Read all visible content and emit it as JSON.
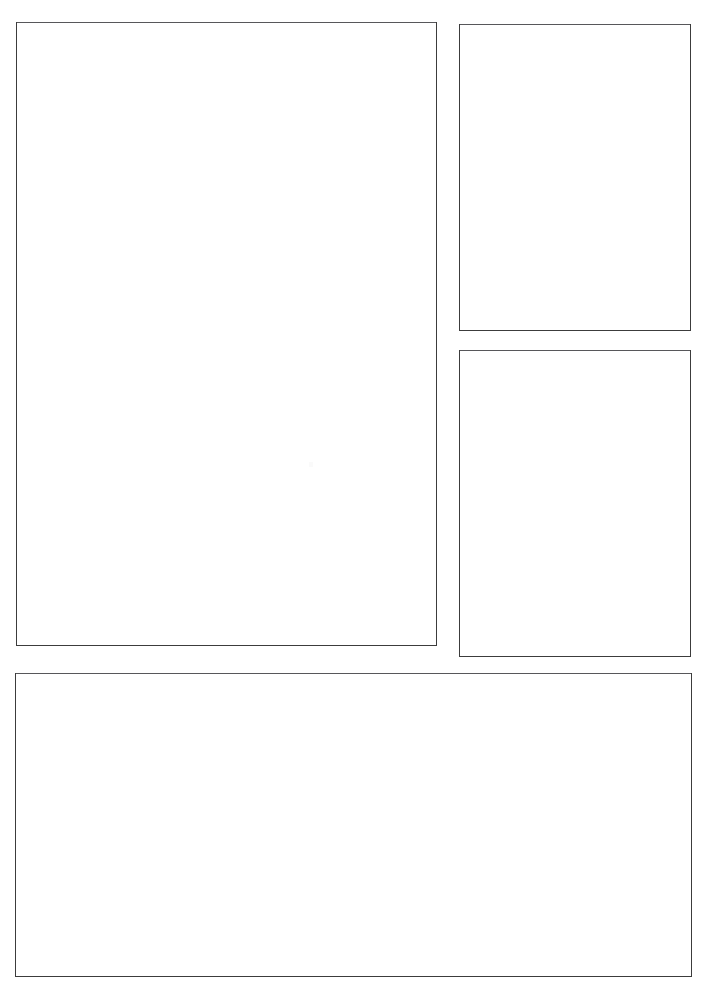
{
  "page": {
    "width": 708,
    "height": 986,
    "background_color": "#ffffff",
    "border_color": "#3c3c3c",
    "border_color_top": "#57575a",
    "border_width_px": 1,
    "content_text": ""
  },
  "panels": [
    {
      "id": "panel-main",
      "name": "main-panel",
      "label": "",
      "content": "",
      "x": 16,
      "y": 22,
      "width": 421,
      "height": 624,
      "fill": "#ffffff",
      "stroke": "#3c3c3c"
    },
    {
      "id": "panel-top-right",
      "name": "top-right-panel",
      "label": "",
      "content": "",
      "x": 459,
      "y": 24,
      "width": 232,
      "height": 307,
      "fill": "#ffffff",
      "stroke": "#3c3c3c"
    },
    {
      "id": "panel-mid-right",
      "name": "middle-right-panel",
      "label": "",
      "content": "",
      "x": 459,
      "y": 350,
      "width": 232,
      "height": 307,
      "fill": "#ffffff",
      "stroke": "#3c3c3c"
    },
    {
      "id": "panel-bottom",
      "name": "bottom-wide-panel",
      "label": "",
      "content": "",
      "x": 15,
      "y": 673,
      "width": 677,
      "height": 304,
      "fill": "#ffffff",
      "stroke": "#3c3c3c"
    }
  ],
  "artifacts": [
    {
      "name": "faint-speck",
      "x": 308,
      "y": 461,
      "color": "#fafafa"
    }
  ]
}
